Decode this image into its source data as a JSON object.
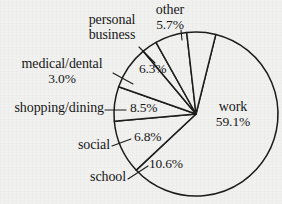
{
  "chart_data": {
    "type": "pie",
    "title": "",
    "subtitle": "",
    "xlabel": "",
    "ylabel": "",
    "legend_position": "none",
    "grid": false,
    "units": "percent",
    "start_angle_deg": -76,
    "direction": "clockwise",
    "categories": [
      "work",
      "school",
      "social",
      "shopping/dining",
      "medical/dental",
      "personal business",
      "other"
    ],
    "values": [
      59.1,
      10.6,
      6.8,
      8.5,
      3.0,
      6.3,
      5.7
    ],
    "slices": [
      {
        "label": "work",
        "value": 59.1,
        "value_text": "59.1%",
        "label_placement": "inside"
      },
      {
        "label": "school",
        "value": 10.6,
        "value_text": "10.6%",
        "label_placement": "outside-leader"
      },
      {
        "label": "social",
        "value": 6.8,
        "value_text": "6.8%",
        "label_placement": "outside-leader"
      },
      {
        "label": "shopping/dining",
        "value": 8.5,
        "value_text": "8.5%",
        "label_placement": "outside-leader"
      },
      {
        "label": "medical/dental",
        "value": 3.0,
        "value_text": "3.0%",
        "label_placement": "outside-leader"
      },
      {
        "label": "personal business",
        "value": 6.3,
        "value_text": "6.3%",
        "label_placement": "outside-leader"
      },
      {
        "label": "other",
        "value": 5.7,
        "value_text": "5.7%",
        "label_placement": "outside-leader"
      }
    ]
  },
  "labels": {
    "work_name": "work",
    "work_pct": "59.1%",
    "school_name": "school",
    "school_pct": "10.6%",
    "social_name": "social",
    "social_pct": "6.8%",
    "shopping_name": "shopping/dining",
    "shopping_pct": "8.5%",
    "medical_name": "medical/dental",
    "medical_pct": "3.0%",
    "personal_name_line1": "personal",
    "personal_name_line2": "business",
    "personal_pct": "6.3%",
    "other_name": "other",
    "other_pct": "5.7%"
  },
  "colors": {
    "background": "#f1f1f0",
    "slice_fill": "#f1f1f0",
    "outline": "#1c1c1c",
    "text": "#171717"
  }
}
